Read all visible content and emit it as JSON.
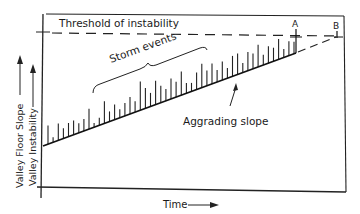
{
  "diagram": {
    "threshold_label": "Threshold of instability",
    "storm_label": "Storm events",
    "slope_label": "Aggrading slope",
    "point_a_label": "A",
    "point_b_label": "B",
    "x_axis_label": "Time",
    "y_axis_label_outer": "Valley Floor Slope",
    "y_axis_label_inner": "Valley Instability",
    "storm_spike_heights": [
      0.55,
      0.15,
      0.5,
      0.3,
      0.4,
      0.42,
      0.28,
      0.35,
      0.6,
      0.12,
      0.22,
      0.65,
      0.3,
      0.45,
      0.25,
      0.38,
      0.5,
      0.32,
      0.85,
      0.6,
      0.4,
      0.7,
      0.5,
      0.35,
      0.6,
      0.45,
      0.7,
      0.3,
      0.25,
      0.5,
      0.7,
      0.45,
      0.6,
      0.35,
      0.55,
      0.3,
      0.6,
      0.62,
      0.28,
      0.55,
      0.45,
      0.65,
      0.3,
      0.5,
      0.4,
      0.6,
      0.25,
      0.42,
      0.35
    ]
  }
}
